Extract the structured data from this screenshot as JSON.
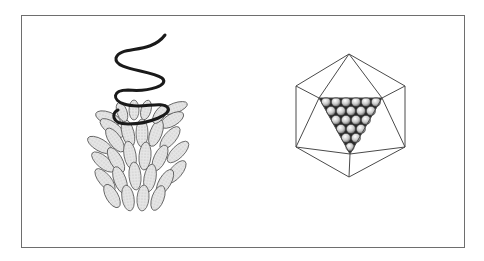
{
  "figure": {
    "panels": [
      {
        "id": "helical",
        "description": "Helical virus: coiled nucleic acid strand with capsomere subunits arranged helically"
      },
      {
        "id": "icosahedral",
        "description": "Icosahedral virus: polyhedral capsid with one face showing packed spherical capsomeres"
      }
    ],
    "colors": {
      "frame": "#6e6e6e",
      "line": "#4a4a4a",
      "helix": "#1a1a1a",
      "subunit_fill": "#e2e2e2",
      "sphere_fill": "#d0d0d0",
      "face_bg": "#2a2a2a"
    }
  }
}
